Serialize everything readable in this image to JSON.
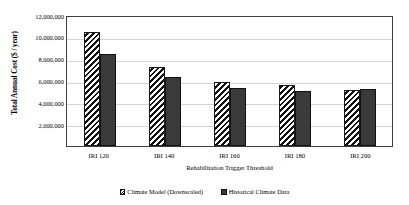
{
  "chart_data": {
    "type": "bar",
    "title": "",
    "categories": [
      "IRI 120",
      "IRI 140",
      "IRI 160",
      "IRI 180",
      "IRI 200"
    ],
    "series": [
      {
        "name": "Climate Model (Downscaled)",
        "key": "model",
        "values": [
          10400000,
          7200000,
          5900000,
          5600000,
          5150000
        ]
      },
      {
        "name": "Historical Climate Data",
        "key": "historical",
        "values": [
          8400000,
          6300000,
          5300000,
          5000000,
          5200000
        ]
      }
    ],
    "xlabel": "Rehabilitation Trigger Threshold",
    "ylabel": "Total Annual Cost ($ / year)",
    "ylim": [
      0,
      12000000
    ],
    "ytick_values": [
      2000000,
      4000000,
      6000000,
      8000000,
      10000000,
      12000000
    ],
    "ytick_labels": [
      "2,000,000",
      "4,000,000",
      "6,000,000",
      "8,000,000",
      "10,000,000",
      "12,000,000"
    ],
    "grid": true,
    "legend_position": "bottom",
    "colors": {
      "model_fill": "#ffffff",
      "model_hatch": "#111111",
      "historical_fill": "#3a3a3a",
      "axis": "#3f3f3f",
      "gridline": "#d4d4d4"
    }
  },
  "legend": {
    "entries": [
      {
        "label": "Climate Model (Downscaled)"
      },
      {
        "label": "Historical Climate Data"
      }
    ]
  }
}
